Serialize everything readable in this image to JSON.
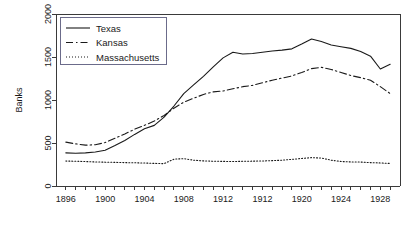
{
  "chart_data": {
    "type": "line",
    "title": "",
    "xlabel": "",
    "ylabel": "Banks",
    "xlim": [
      1895,
      1930
    ],
    "ylim": [
      0,
      2000
    ],
    "grid": false,
    "legend_position": "top-left",
    "x_tick_labels": [
      "1896",
      "1900",
      "1904",
      "1908",
      "1912",
      "1912",
      "1920",
      "1924",
      "1928"
    ],
    "x_tick_values": [
      1896,
      1900,
      1904,
      1908,
      1912,
      1916,
      1920,
      1924,
      1928
    ],
    "y_tick_labels": [
      "0",
      "500",
      "1000",
      "1500",
      "2000"
    ],
    "y_tick_values": [
      0,
      500,
      1000,
      1500,
      2000
    ],
    "x": [
      1896,
      1897,
      1898,
      1899,
      1900,
      1901,
      1902,
      1903,
      1904,
      1905,
      1906,
      1907,
      1908,
      1909,
      1910,
      1911,
      1912,
      1913,
      1914,
      1915,
      1916,
      1917,
      1918,
      1919,
      1920,
      1921,
      1922,
      1923,
      1924,
      1925,
      1926,
      1927,
      1928,
      1929
    ],
    "series": [
      {
        "name": "Texas",
        "style": "solid",
        "values": [
          385,
          380,
          385,
          395,
          415,
          470,
          530,
          600,
          665,
          705,
          800,
          930,
          1075,
          1175,
          1275,
          1385,
          1490,
          1555,
          1535,
          1540,
          1555,
          1570,
          1580,
          1595,
          1650,
          1710,
          1680,
          1640,
          1620,
          1600,
          1565,
          1510,
          1360,
          1415
        ]
      },
      {
        "name": "Kansas",
        "style": "dashed",
        "values": [
          510,
          490,
          475,
          480,
          505,
          555,
          605,
          660,
          705,
          755,
          820,
          905,
          975,
          1020,
          1065,
          1095,
          1105,
          1130,
          1155,
          1170,
          1200,
          1230,
          1255,
          1280,
          1320,
          1365,
          1380,
          1355,
          1320,
          1285,
          1260,
          1230,
          1155,
          1075
        ]
      },
      {
        "name": "Massachusetts",
        "style": "dotted",
        "values": [
          290,
          288,
          284,
          280,
          277,
          275,
          272,
          270,
          267,
          263,
          260,
          312,
          318,
          300,
          292,
          288,
          286,
          285,
          287,
          289,
          291,
          295,
          300,
          310,
          320,
          330,
          325,
          300,
          285,
          280,
          278,
          272,
          268,
          262
        ]
      }
    ],
    "legend_entries": [
      {
        "label": "Texas",
        "style": "solid"
      },
      {
        "label": "Kansas",
        "style": "dashed"
      },
      {
        "label": "Massachusetts",
        "style": "dotted"
      }
    ]
  }
}
